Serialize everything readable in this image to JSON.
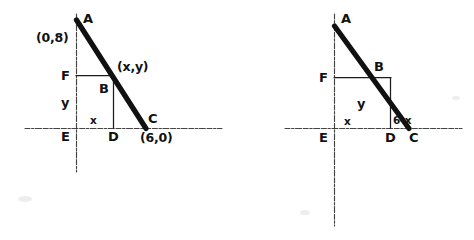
{
  "figure": {
    "kind": "hand-drawn-geometry-diagram",
    "background_color": "#ffffff",
    "ink_color": "#111111",
    "axis_color": "#2b2b2b",
    "panels": [
      {
        "id": "left-panel",
        "name": "coordinate-triangle-with-coordinates",
        "labels": {
          "vertex_a": "A",
          "vertex_b": "B",
          "vertex_c": "C",
          "vertex_d": "D",
          "vertex_e": "E",
          "vertex_f": "F",
          "point_a_coordinate": "(0,8)",
          "point_b_coordinate": "(x,y)",
          "point_c_coordinate": "(6,0)",
          "segment_horizontal": "x",
          "segment_vertical": "y"
        },
        "geometry": {
          "y_axis_x": 76,
          "y_axis_top": 14,
          "y_axis_bottom": 172,
          "x_axis_y": 128,
          "x_axis_left": 25,
          "x_axis_right": 222,
          "a_point": [
            76,
            20
          ],
          "b_point": [
            113,
            75
          ],
          "c_point": [
            146,
            128
          ],
          "d_point": [
            113,
            128
          ],
          "f_point": [
            76,
            75
          ]
        }
      },
      {
        "id": "right-panel",
        "name": "coordinate-triangle-with-expressions",
        "labels": {
          "vertex_a": "A",
          "vertex_b": "B",
          "vertex_c": "C",
          "vertex_d": "D",
          "vertex_e": "E",
          "vertex_f": "F",
          "segment_horizontal": "x",
          "segment_vertical": "y",
          "segment_remainder": "6-x"
        },
        "geometry": {
          "y_axis_x": 334,
          "y_axis_top": 14,
          "y_axis_bottom": 226,
          "x_axis_y": 128,
          "x_axis_left": 285,
          "x_axis_right": 462,
          "a_point": [
            334,
            26
          ],
          "b_point": [
            390,
            77
          ],
          "c_point": [
            409,
            128
          ],
          "d_point": [
            390,
            128
          ],
          "f_point": [
            334,
            77
          ]
        }
      }
    ]
  }
}
